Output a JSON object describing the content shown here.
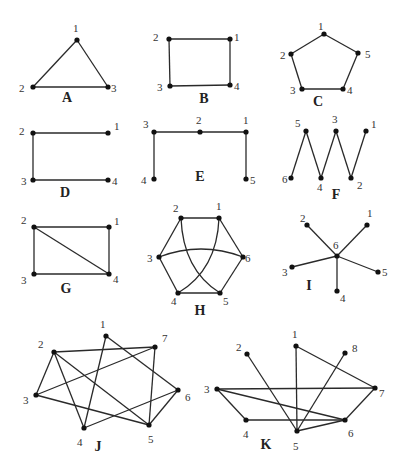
{
  "figure": {
    "width": 408,
    "height": 474,
    "colors": {
      "edge": "#2a2a2a",
      "node": "#111111",
      "text": "#333333"
    }
  },
  "graphs": [
    {
      "id": "A",
      "label": {
        "text": "A",
        "x": 67,
        "y": 102
      },
      "nodes": [
        {
          "id": "1",
          "x": 77,
          "y": 40,
          "lx": 73,
          "ly": 32
        },
        {
          "id": "2",
          "x": 33,
          "y": 87,
          "lx": 19,
          "ly": 92
        },
        {
          "id": "3",
          "x": 108,
          "y": 87,
          "lx": 111,
          "ly": 92
        }
      ],
      "edges": [
        [
          "1",
          "2"
        ],
        [
          "1",
          "3"
        ],
        [
          "2",
          "3"
        ]
      ]
    },
    {
      "id": "B",
      "label": {
        "text": "B",
        "x": 204,
        "y": 103
      },
      "nodes": [
        {
          "id": "1",
          "x": 230,
          "y": 39,
          "lx": 234,
          "ly": 41
        },
        {
          "id": "2",
          "x": 169,
          "y": 39,
          "lx": 153,
          "ly": 41
        },
        {
          "id": "3",
          "x": 170,
          "y": 86,
          "lx": 157,
          "ly": 91
        },
        {
          "id": "4",
          "x": 230,
          "y": 85,
          "lx": 234,
          "ly": 90
        }
      ],
      "edges": [
        [
          "1",
          "2"
        ],
        [
          "2",
          "3"
        ],
        [
          "3",
          "4"
        ],
        [
          "4",
          "1"
        ]
      ]
    },
    {
      "id": "C",
      "label": {
        "text": "C",
        "x": 318,
        "y": 106
      },
      "nodes": [
        {
          "id": "1",
          "x": 324,
          "y": 34,
          "lx": 318,
          "ly": 30
        },
        {
          "id": "2",
          "x": 291,
          "y": 54,
          "lx": 280,
          "ly": 59
        },
        {
          "id": "3",
          "x": 302,
          "y": 89,
          "lx": 290,
          "ly": 94
        },
        {
          "id": "4",
          "x": 343,
          "y": 89,
          "lx": 347,
          "ly": 94
        },
        {
          "id": "5",
          "x": 358,
          "y": 53,
          "lx": 365,
          "ly": 58
        }
      ],
      "edges": [
        [
          "1",
          "2"
        ],
        [
          "2",
          "3"
        ],
        [
          "3",
          "4"
        ],
        [
          "4",
          "5"
        ],
        [
          "5",
          "1"
        ]
      ]
    },
    {
      "id": "D",
      "label": {
        "text": "D",
        "x": 65,
        "y": 197
      },
      "nodes": [
        {
          "id": "1",
          "x": 108,
          "y": 133,
          "lx": 114,
          "ly": 130
        },
        {
          "id": "2",
          "x": 33,
          "y": 133,
          "lx": 19,
          "ly": 135
        },
        {
          "id": "3",
          "x": 33,
          "y": 180,
          "lx": 21,
          "ly": 185
        },
        {
          "id": "4",
          "x": 108,
          "y": 180,
          "lx": 112,
          "ly": 185
        }
      ],
      "edges": [
        [
          "1",
          "2"
        ],
        [
          "2",
          "3"
        ],
        [
          "3",
          "4"
        ]
      ]
    },
    {
      "id": "E",
      "label": {
        "text": "E",
        "x": 200,
        "y": 181
      },
      "nodes": [
        {
          "id": "1",
          "x": 246,
          "y": 132,
          "lx": 243,
          "ly": 124
        },
        {
          "id": "2",
          "x": 200,
          "y": 132,
          "lx": 196,
          "ly": 124
        },
        {
          "id": "3",
          "x": 154,
          "y": 132,
          "lx": 143,
          "ly": 128
        },
        {
          "id": "4",
          "x": 154,
          "y": 179,
          "lx": 141,
          "ly": 184
        },
        {
          "id": "5",
          "x": 246,
          "y": 179,
          "lx": 250,
          "ly": 184
        }
      ],
      "edges": [
        [
          "3",
          "2"
        ],
        [
          "2",
          "1"
        ],
        [
          "3",
          "4"
        ],
        [
          "1",
          "5"
        ]
      ]
    },
    {
      "id": "F",
      "label": {
        "text": "F",
        "x": 336,
        "y": 199
      },
      "nodes": [
        {
          "id": "1",
          "x": 366,
          "y": 131,
          "lx": 371,
          "ly": 128
        },
        {
          "id": "2",
          "x": 351,
          "y": 178,
          "lx": 357,
          "ly": 189
        },
        {
          "id": "3",
          "x": 336,
          "y": 131,
          "lx": 332,
          "ly": 123
        },
        {
          "id": "4",
          "x": 321,
          "y": 178,
          "lx": 317,
          "ly": 191
        },
        {
          "id": "5",
          "x": 306,
          "y": 131,
          "lx": 295,
          "ly": 127
        },
        {
          "id": "6",
          "x": 291,
          "y": 178,
          "lx": 282,
          "ly": 183
        }
      ],
      "edges": [
        [
          "6",
          "5"
        ],
        [
          "5",
          "4"
        ],
        [
          "4",
          "3"
        ],
        [
          "3",
          "2"
        ],
        [
          "2",
          "1"
        ]
      ]
    },
    {
      "id": "G",
      "label": {
        "text": "G",
        "x": 66,
        "y": 293
      },
      "nodes": [
        {
          "id": "1",
          "x": 109,
          "y": 227,
          "lx": 114,
          "ly": 225
        },
        {
          "id": "2",
          "x": 34,
          "y": 227,
          "lx": 21,
          "ly": 224
        },
        {
          "id": "3",
          "x": 34,
          "y": 274,
          "lx": 21,
          "ly": 284
        },
        {
          "id": "4",
          "x": 109,
          "y": 274,
          "lx": 113,
          "ly": 283
        }
      ],
      "edges": [
        [
          "1",
          "2"
        ],
        [
          "2",
          "3"
        ],
        [
          "3",
          "4"
        ],
        [
          "4",
          "1"
        ],
        [
          "2",
          "4"
        ]
      ]
    },
    {
      "id": "H",
      "label": {
        "text": "H",
        "x": 200,
        "y": 315
      },
      "nodes": [
        {
          "id": "1",
          "x": 219,
          "y": 218,
          "lx": 216,
          "ly": 210
        },
        {
          "id": "2",
          "x": 181,
          "y": 218,
          "lx": 173,
          "ly": 212
        },
        {
          "id": "3",
          "x": 159,
          "y": 257,
          "lx": 147,
          "ly": 262
        },
        {
          "id": "4",
          "x": 178,
          "y": 293,
          "lx": 171,
          "ly": 305
        },
        {
          "id": "5",
          "x": 220,
          "y": 293,
          "lx": 223,
          "ly": 305
        },
        {
          "id": "6",
          "x": 243,
          "y": 257,
          "lx": 245,
          "ly": 262
        }
      ],
      "edges": [
        [
          "1",
          "2"
        ],
        [
          "2",
          "3"
        ],
        [
          "3",
          "4"
        ],
        [
          "4",
          "5"
        ],
        [
          "5",
          "6"
        ],
        [
          "6",
          "1"
        ]
      ],
      "curved_edges": [
        {
          "from": "3",
          "to": "6",
          "cx": 201,
          "cy": 241
        },
        {
          "from": "2",
          "to": "5",
          "cx": 183,
          "cy": 270
        },
        {
          "from": "1",
          "to": "4",
          "cx": 217,
          "cy": 270
        }
      ]
    },
    {
      "id": "I",
      "label": {
        "text": "I",
        "x": 309,
        "y": 290
      },
      "nodes": [
        {
          "id": "1",
          "x": 367,
          "y": 225,
          "lx": 367,
          "ly": 217
        },
        {
          "id": "2",
          "x": 307,
          "y": 225,
          "lx": 300,
          "ly": 222
        },
        {
          "id": "3",
          "x": 292,
          "y": 267,
          "lx": 282,
          "ly": 276
        },
        {
          "id": "4",
          "x": 337,
          "y": 291,
          "lx": 340,
          "ly": 302
        },
        {
          "id": "5",
          "x": 378,
          "y": 272,
          "lx": 382,
          "ly": 276
        },
        {
          "id": "6",
          "x": 337,
          "y": 256,
          "lx": 333,
          "ly": 249
        }
      ],
      "edges": [
        [
          "6",
          "1"
        ],
        [
          "6",
          "2"
        ],
        [
          "6",
          "3"
        ],
        [
          "6",
          "4"
        ],
        [
          "6",
          "5"
        ]
      ]
    },
    {
      "id": "J",
      "label": {
        "text": "J",
        "x": 98,
        "y": 451
      },
      "nodes": [
        {
          "id": "1",
          "x": 106,
          "y": 336,
          "lx": 100,
          "ly": 328
        },
        {
          "id": "2",
          "x": 54,
          "y": 352,
          "lx": 38,
          "ly": 348
        },
        {
          "id": "3",
          "x": 36,
          "y": 395,
          "lx": 23,
          "ly": 404
        },
        {
          "id": "4",
          "x": 84,
          "y": 428,
          "lx": 77,
          "ly": 446
        },
        {
          "id": "5",
          "x": 149,
          "y": 425,
          "lx": 148,
          "ly": 443
        },
        {
          "id": "6",
          "x": 178,
          "y": 390,
          "lx": 185,
          "ly": 401
        },
        {
          "id": "7",
          "x": 155,
          "y": 347,
          "lx": 162,
          "ly": 342
        }
      ],
      "edges": [
        [
          "1",
          "4"
        ],
        [
          "1",
          "6"
        ],
        [
          "2",
          "7"
        ],
        [
          "2",
          "3"
        ],
        [
          "2",
          "4"
        ],
        [
          "2",
          "5"
        ],
        [
          "3",
          "7"
        ],
        [
          "3",
          "5"
        ],
        [
          "4",
          "6"
        ],
        [
          "5",
          "7"
        ],
        [
          "5",
          "6"
        ]
      ]
    },
    {
      "id": "K",
      "label": {
        "text": "K",
        "x": 266,
        "y": 449
      },
      "nodes": [
        {
          "id": "1",
          "x": 296,
          "y": 346,
          "lx": 292,
          "ly": 338
        },
        {
          "id": "2",
          "x": 247,
          "y": 354,
          "lx": 236,
          "ly": 351
        },
        {
          "id": "3",
          "x": 217,
          "y": 389,
          "lx": 204,
          "ly": 393
        },
        {
          "id": "4",
          "x": 246,
          "y": 420,
          "lx": 243,
          "ly": 438
        },
        {
          "id": "5",
          "x": 297,
          "y": 431,
          "lx": 293,
          "ly": 450
        },
        {
          "id": "6",
          "x": 345,
          "y": 420,
          "lx": 348,
          "ly": 437
        },
        {
          "id": "7",
          "x": 375,
          "y": 388,
          "lx": 379,
          "ly": 397
        },
        {
          "id": "8",
          "x": 345,
          "y": 353,
          "lx": 352,
          "ly": 352
        }
      ],
      "edges": [
        [
          "2",
          "5"
        ],
        [
          "1",
          "5"
        ],
        [
          "1",
          "7"
        ],
        [
          "8",
          "5"
        ],
        [
          "3",
          "7"
        ],
        [
          "3",
          "4"
        ],
        [
          "3",
          "6"
        ],
        [
          "4",
          "6"
        ],
        [
          "5",
          "6"
        ],
        [
          "6",
          "7"
        ]
      ]
    }
  ]
}
